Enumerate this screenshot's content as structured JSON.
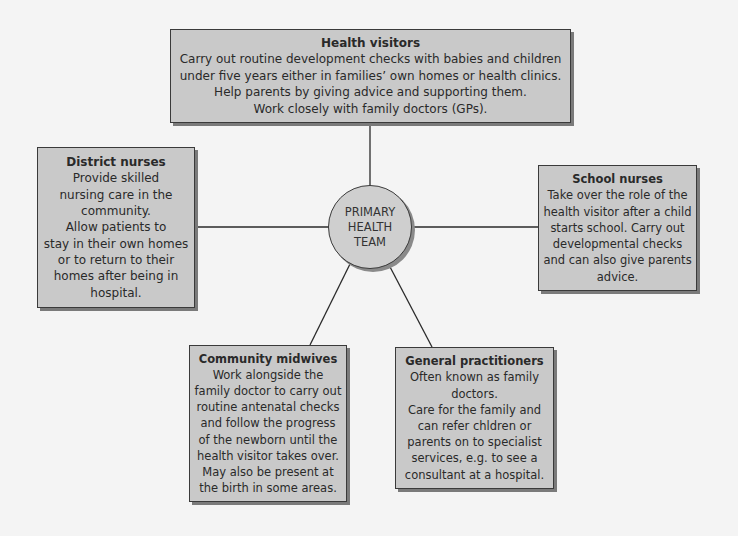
{
  "hub": {
    "lines": [
      "PRIMARY",
      "HEALTH",
      "TEAM"
    ]
  },
  "nodes": {
    "health_visitors": {
      "title": "Health visitors",
      "lines": [
        "Carry out routine development checks with babies and children",
        "under five years either in families’ own homes or health clinics.",
        "Help parents by giving advice and supporting them.",
        "Work closely with family doctors (GPs)."
      ]
    },
    "district_nurses": {
      "title": "District nurses",
      "lines": [
        "Provide skilled",
        "nursing care in the",
        "community.",
        "Allow patients to",
        "stay in their own homes",
        "or to return to their",
        "homes after being in",
        "hospital."
      ]
    },
    "school_nurses": {
      "title": "School nurses",
      "lines": [
        "Take over the role of the",
        "health visitor after a child",
        "starts school. Carry out",
        "developmental checks",
        "and can also give parents",
        "advice."
      ]
    },
    "community_midwives": {
      "title": "Community midwives",
      "lines": [
        "Work alongside the",
        "family doctor to carry out",
        "routine antenatal checks",
        "and follow the progress",
        "of the newborn until the",
        "health visitor takes over.",
        "May also be present at",
        "the birth in some areas."
      ]
    },
    "general_practitioners": {
      "title": "General practitioners",
      "lines": [
        "Often known as family",
        "doctors.",
        "Care for the family and",
        "can refer chldren or",
        "parents on to specialist",
        "services, e.g. to see a",
        "consultant at a hospital."
      ]
    }
  },
  "colors": {
    "box_fill": "#c9c9c9",
    "box_border": "#3a3a3a",
    "shadow": "#7a7a7a",
    "background": "#f4f4f4",
    "connector": "#2a2a2a"
  }
}
